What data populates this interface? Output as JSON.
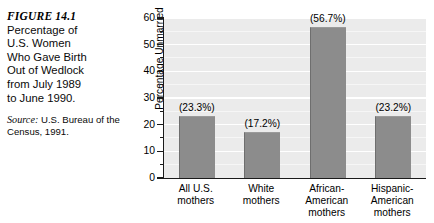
{
  "figure": {
    "number": "FIGURE 14.1",
    "caption_lines": [
      "Percentage of",
      "U.S. Women",
      "Who Gave Birth",
      "Out of Wedlock",
      "from July 1989",
      "to June 1990."
    ],
    "source_label": "Source:",
    "source_text": " U.S. Bureau of the Census, 1991."
  },
  "chart_data": {
    "type": "bar",
    "xlabel": "",
    "ylabel": "Percentage Unmarried",
    "ylim": [
      0,
      60
    ],
    "yticks": [
      0,
      10,
      20,
      30,
      40,
      50,
      60
    ],
    "ytick_labels": [
      "0",
      "10",
      "20",
      "30",
      "40",
      "50",
      "60"
    ],
    "minor_tick_step": 5,
    "grid": true,
    "legend": "none",
    "categories": [
      "All U.S. mothers",
      "White mothers",
      "African-American mothers",
      "Hispanic-American mothers"
    ],
    "category_lines": [
      [
        "All U.S.",
        "mothers"
      ],
      [
        "White",
        "mothers"
      ],
      [
        "African-",
        "American",
        "mothers"
      ],
      [
        "Hispanic-",
        "American",
        "mothers"
      ]
    ],
    "values": [
      23.3,
      17.2,
      56.7,
      23.2
    ],
    "data_labels": [
      "(23.3%)",
      "(17.2%)",
      "(56.7%)",
      "(23.2%)"
    ],
    "colors": {
      "bar_fill": "#8c8c8c",
      "plot_background": "#ebebeb",
      "gridline": "#ffffff",
      "axis": "#1a1a1a",
      "text": "#000000"
    }
  }
}
